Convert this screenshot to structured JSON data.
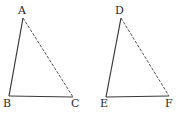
{
  "figure": {
    "triangles": [
      {
        "name": "ABC",
        "vertices": {
          "A": {
            "label": "A",
            "x": 23,
            "y": 18
          },
          "B": {
            "label": "B",
            "x": 9,
            "y": 96
          },
          "C": {
            "label": "C",
            "x": 73,
            "y": 97
          }
        }
      },
      {
        "name": "DEF",
        "vertices": {
          "D": {
            "label": "D",
            "x": 121,
            "y": 18
          },
          "E": {
            "label": "E",
            "x": 106,
            "y": 97
          },
          "F": {
            "label": "F",
            "x": 169,
            "y": 96
          }
        }
      }
    ],
    "colors": {
      "line": "#3a3a3a",
      "text": "#2a2a2a",
      "background": "#ffffff"
    }
  }
}
